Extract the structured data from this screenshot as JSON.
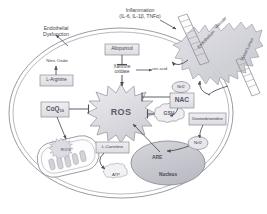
{
  "diagram": {
    "title_hidden": "Cellular oxidative stress and antioxidant pathway",
    "colors": {
      "cell_membrane": "#9a9aa2",
      "box_fill": "#e3e3e8",
      "box_stroke": "#8d8d96",
      "ros_fill": "#d9d9de",
      "ros_stroke": "#9a9aa2",
      "nucleus_fill": "#c9c9d0",
      "nucleus_stroke": "#8d8d96",
      "arrow": "#4f4f58",
      "text": "#4a4a52",
      "gsh_fill": "#ebebef",
      "endothelium_fill": "#cfcfd6"
    },
    "outside_labels": {
      "inflammation_line1": "Inflammation",
      "inflammation_line2": "(IL-6, IL-1β, TNFα)",
      "endothelial_line1": "Endothelial",
      "endothelial_line2": "Dysfunction"
    },
    "nodes": {
      "nitric_oxide": "Nitric Oxide",
      "l_arginine": "L-Arginine",
      "allopurinol": "Allopurinol",
      "xanthine_oxidase_line1": "Xanthine",
      "xanthine_oxidase_line2": "oxidase",
      "uric_acid": "uric acid",
      "ros": "ROS",
      "ros_mito": "ROS",
      "coq10_name": "CoQ",
      "coq10_sub": "10",
      "nac": "NAC",
      "nac_top": "Nrf2",
      "gsh": "GSH",
      "dexmedetomidine": "Dexmedetomidine",
      "nrf2": "Nrf2",
      "are": "ARE",
      "nucleus": "Nucleus",
      "l_carnitine": "L-Carnitine",
      "atp": "ATP",
      "endothelium_rot1": "Endothelium",
      "endothelium_rot2": "Vascular",
      "vessel_rot": "Vessel Lumen"
    }
  }
}
